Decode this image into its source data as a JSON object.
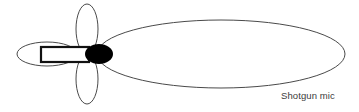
{
  "figure": {
    "caption": "Shotgun mic",
    "background_color": "#ffffff",
    "outline_color": "#4a4a4a",
    "capsule_color": "#000000",
    "body_stroke_color": "#111111",
    "caption_color": "#3b3b3b"
  },
  "chart_data": {
    "type": "polar_pattern",
    "title": "Shotgun mic",
    "pattern_name": "Lobar (shotgun) polar pattern",
    "grid": false,
    "legend": null,
    "xlabel": "",
    "ylabel": "",
    "origin": {
      "x": 97,
      "y": 54
    },
    "lobes": [
      {
        "name": "front-lobe",
        "direction": "front",
        "shape": "ellipse",
        "cx": 221,
        "cy": 54,
        "rx": 124,
        "ry": 34,
        "filled": false
      },
      {
        "name": "upper-side-lobe",
        "direction": "up",
        "shape": "ellipse",
        "cx": 87,
        "cy": 29,
        "rx": 11,
        "ry": 25,
        "filled": false
      },
      {
        "name": "lower-side-lobe",
        "direction": "down",
        "shape": "ellipse",
        "cx": 87,
        "cy": 79,
        "rx": 11,
        "ry": 25,
        "filled": false
      },
      {
        "name": "rear-lobe",
        "direction": "rear",
        "shape": "ellipse",
        "cx": 47,
        "cy": 54,
        "rx": 30,
        "ry": 12,
        "filled": false
      }
    ],
    "microphone": {
      "body": {
        "x": 41,
        "y": 47,
        "width": 48,
        "height": 15,
        "shape": "rectangle"
      },
      "capsule": {
        "cx": 99,
        "cy": 54,
        "rx": 14,
        "ry": 10,
        "shape": "ellipse"
      }
    }
  }
}
